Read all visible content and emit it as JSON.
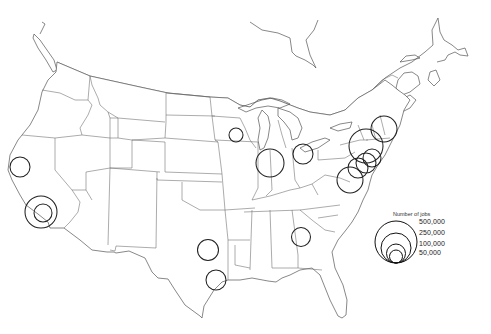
{
  "map": {
    "region": "Contiguous United States and southeastern Canada",
    "style": "black-and-white outline map with state boundaries",
    "colors": {
      "background": "#ffffff",
      "outline": "#555555",
      "circles": "#222222"
    }
  },
  "legend": {
    "title": "Number of jobs",
    "entries": [
      {
        "label": "500,000",
        "value": 500000,
        "radius": 21
      },
      {
        "label": "250,000",
        "value": 250000,
        "radius": 15
      },
      {
        "label": "100,000",
        "value": 100000,
        "radius": 9.5
      },
      {
        "label": "50,000",
        "value": 50000,
        "radius": 6.5
      }
    ]
  },
  "circles": [
    {
      "location": "San Francisco Bay Area",
      "cx": 20,
      "cy": 167,
      "r": 10
    },
    {
      "location": "Los Angeles (outer)",
      "cx": 41,
      "cy": 212,
      "r": 16
    },
    {
      "location": "Los Angeles (inner)",
      "cx": 43,
      "cy": 213,
      "r": 9
    },
    {
      "location": "Minneapolis",
      "cx": 236,
      "cy": 135,
      "r": 7
    },
    {
      "location": "Chicago",
      "cx": 270,
      "cy": 163,
      "r": 14
    },
    {
      "location": "Detroit",
      "cx": 303,
      "cy": 154,
      "r": 10
    },
    {
      "location": "Boston",
      "cx": 384,
      "cy": 129,
      "r": 13
    },
    {
      "location": "New York",
      "cx": 366,
      "cy": 146,
      "r": 17
    },
    {
      "location": "New York / New Jersey",
      "cx": 372,
      "cy": 158,
      "r": 9
    },
    {
      "location": "Philadelphia",
      "cx": 366,
      "cy": 163,
      "r": 10
    },
    {
      "location": "Baltimore",
      "cx": 358,
      "cy": 168,
      "r": 10
    },
    {
      "location": "Washington DC",
      "cx": 350,
      "cy": 180,
      "r": 13
    },
    {
      "location": "Atlanta",
      "cx": 301,
      "cy": 237,
      "r": 9.5
    },
    {
      "location": "Dallas",
      "cx": 208,
      "cy": 250,
      "r": 10.5
    },
    {
      "location": "Houston",
      "cx": 216,
      "cy": 280,
      "r": 10
    }
  ]
}
